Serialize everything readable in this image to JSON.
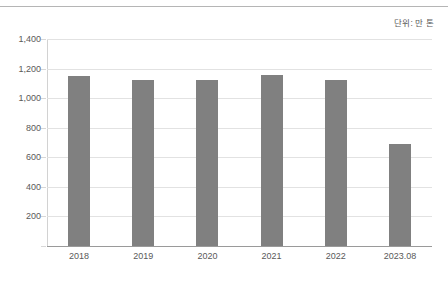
{
  "annotation": {
    "unit_note": "단위: 만 톤"
  },
  "chart_data": {
    "type": "bar",
    "title": "",
    "subtitle": "",
    "xlabel": "",
    "ylabel": "",
    "unit_note": "단위: 만 톤",
    "categories": [
      "2018",
      "2019",
      "2020",
      "2021",
      "2022",
      "2023.08"
    ],
    "values": [
      1150,
      1125,
      1125,
      1155,
      1120,
      690
    ],
    "series": [
      {
        "name": "",
        "values": [
          1150,
          1125,
          1125,
          1155,
          1120,
          690
        ],
        "color": "#808080"
      }
    ],
    "ylim": [
      0,
      1400
    ],
    "ytick_values": [
      0,
      200,
      400,
      600,
      800,
      1000,
      1200,
      1400
    ],
    "ytick_labels": [
      "",
      "200",
      "400",
      "600",
      "800",
      "1,000",
      "1,200",
      "1,400"
    ],
    "grid": true,
    "grid_axis": "y",
    "legend": false,
    "legend_position": "none",
    "bar_color": "#808080",
    "gridline_color": "#e2e2e2",
    "axis_color": "#9a9a9a",
    "text_color": "#595959"
  }
}
